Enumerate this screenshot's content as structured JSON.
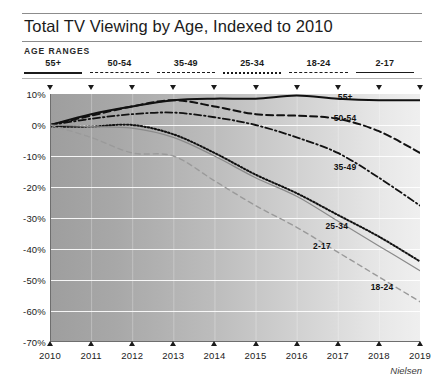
{
  "header": {
    "title": "Total TV Viewing by Age, Indexed to 2010",
    "legend_title": "AGE RANGES"
  },
  "legend": {
    "items": [
      {
        "label": "55+",
        "style": "solid"
      },
      {
        "label": "50-54",
        "style": "dashed-long"
      },
      {
        "label": "35-49",
        "style": "dash-dot"
      },
      {
        "label": "25-34",
        "style": "dotted"
      },
      {
        "label": "18-24",
        "style": "dashed-medium"
      },
      {
        "label": "2-17",
        "style": "solid-thin"
      }
    ]
  },
  "source": "Nielsen",
  "chart_data": {
    "type": "line",
    "title": "Total TV Viewing by Age, Indexed to 2010",
    "xlabel": "",
    "ylabel": "",
    "x": [
      2010,
      2011,
      2012,
      2013,
      2014,
      2015,
      2016,
      2017,
      2018,
      2019
    ],
    "xtick_labels": [
      "2010",
      "2011",
      "2012",
      "2013",
      "2014",
      "2015",
      "2016",
      "2017",
      "2018",
      "2019"
    ],
    "ytick_labels": [
      "10%",
      "0%",
      "-10%",
      "-20%",
      "-30%",
      "-40%",
      "-50%",
      "-60%",
      "-70%"
    ],
    "ytick_values": [
      10,
      0,
      -10,
      -20,
      -30,
      -40,
      -50,
      -60,
      -70
    ],
    "ylim": [
      -70,
      10
    ],
    "xlim": [
      2010,
      2019
    ],
    "grid": true,
    "legend_position": "top",
    "series": [
      {
        "name": "55+",
        "style": "solid",
        "color": "#111111",
        "values": [
          0,
          3.5,
          6,
          8,
          8.5,
          8.5,
          9.5,
          8.5,
          8,
          8
        ]
      },
      {
        "name": "50-54",
        "style": "dashed-long",
        "color": "#111111",
        "values": [
          0,
          3,
          6,
          8,
          6,
          3.5,
          3,
          2,
          -2,
          -9
        ]
      },
      {
        "name": "35-49",
        "style": "dash-dot",
        "color": "#111111",
        "values": [
          0,
          2,
          3.5,
          4,
          2.5,
          0,
          -4,
          -9,
          -17,
          -26
        ]
      },
      {
        "name": "25-34",
        "style": "dotted",
        "color": "#111111",
        "values": [
          -0.5,
          -0.5,
          0,
          -3,
          -9,
          -16,
          -22,
          -29,
          -36,
          -44
        ]
      },
      {
        "name": "2-17",
        "style": "solid-thin",
        "color": "#8a8a8a",
        "values": [
          0,
          -0.5,
          -1,
          -4,
          -10,
          -17,
          -23,
          -31,
          -39,
          -47
        ]
      },
      {
        "name": "18-24",
        "style": "dashed-medium",
        "color": "#9a9a9a",
        "values": [
          0,
          -4,
          -9,
          -10,
          -18,
          -26,
          -33,
          -41,
          -49,
          -57
        ]
      }
    ],
    "inline_labels": [
      {
        "text": "55+",
        "x": 2017.0,
        "y": 10.5
      },
      {
        "text": "50-54",
        "x": 2016.9,
        "y": 4.0
      },
      {
        "text": "35-49",
        "x": 2016.9,
        "y": -12.0
      },
      {
        "text": "25-34",
        "x": 2016.7,
        "y": -31.0
      },
      {
        "text": "2-17",
        "x": 2016.4,
        "y": -37.5
      },
      {
        "text": "18-24",
        "x": 2017.8,
        "y": -50.5
      }
    ],
    "top_markers": [
      2010,
      2011,
      2012,
      2013,
      2014,
      2015,
      2016,
      2017,
      2018,
      2019
    ]
  }
}
